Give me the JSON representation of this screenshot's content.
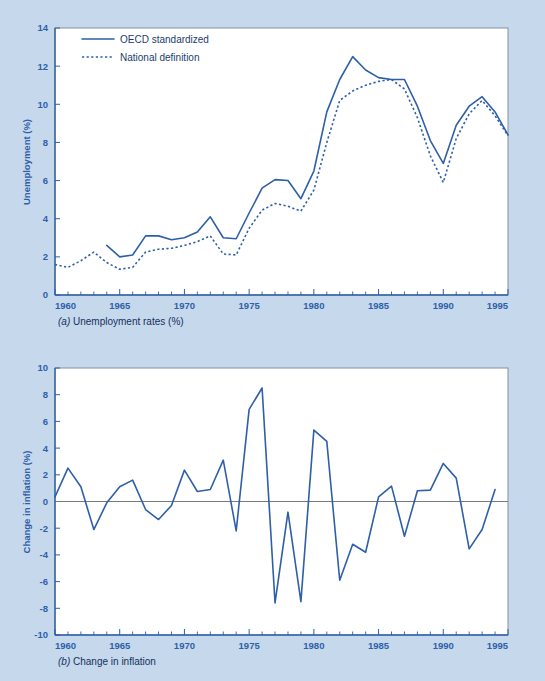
{
  "figure": {
    "background_color": "#c6d8ec",
    "line_color": "#2e5fa8",
    "plot_background": "#ffffff"
  },
  "chart_data": [
    {
      "type": "line",
      "panel": "a",
      "title": "",
      "caption_prefix": "(a)",
      "caption": " Unemployment rates (%)",
      "xlabel": "",
      "ylabel": "Unemployment (%)",
      "xlim": [
        1960,
        1995
      ],
      "ylim": [
        0,
        14
      ],
      "xticks": [
        1960,
        1965,
        1970,
        1975,
        1980,
        1985,
        1990,
        1995
      ],
      "xticklabels": [
        "1960",
        "1965",
        "1970",
        "1975",
        "1980",
        "1985",
        "1990",
        "1995"
      ],
      "yticks": [
        0,
        2,
        4,
        6,
        8,
        10,
        12,
        14
      ],
      "yticklabels": [
        "0",
        "2",
        "4",
        "6",
        "8",
        "10",
        "12",
        "14"
      ],
      "grid": false,
      "legend_position": "upper-left",
      "minor_x_tick_step": 1,
      "series": [
        {
          "name": "OECD standardized",
          "style": "solid",
          "x": [
            1964,
            1965,
            1966,
            1967,
            1968,
            1969,
            1970,
            1971,
            1972,
            1973,
            1974,
            1975,
            1976,
            1977,
            1978,
            1979,
            1980,
            1981,
            1982,
            1983,
            1984,
            1985,
            1986,
            1987,
            1988,
            1989,
            1990,
            1991,
            1992,
            1993,
            1994,
            1995
          ],
          "values": [
            2.6,
            2.0,
            2.1,
            3.1,
            3.1,
            2.9,
            3.0,
            3.3,
            4.1,
            3.0,
            2.95,
            4.3,
            5.6,
            6.05,
            6.0,
            5.05,
            6.5,
            9.6,
            11.3,
            12.5,
            11.8,
            11.4,
            11.3,
            11.3,
            9.9,
            8.1,
            6.9,
            8.9,
            9.9,
            10.4,
            9.6,
            8.4
          ]
        },
        {
          "name": "National definition",
          "style": "dotted",
          "x": [
            1960,
            1961,
            1962,
            1963,
            1964,
            1965,
            1966,
            1967,
            1968,
            1969,
            1970,
            1971,
            1972,
            1973,
            1974,
            1975,
            1976,
            1977,
            1978,
            1979,
            1980,
            1981,
            1982,
            1983,
            1984,
            1985,
            1986,
            1987,
            1988,
            1989,
            1990,
            1991,
            1992,
            1993,
            1994,
            1995
          ],
          "values": [
            1.6,
            1.45,
            1.8,
            2.25,
            1.7,
            1.35,
            1.45,
            2.25,
            2.4,
            2.45,
            2.6,
            2.8,
            3.1,
            2.15,
            2.1,
            3.5,
            4.45,
            4.8,
            4.65,
            4.4,
            5.5,
            8.0,
            10.2,
            10.7,
            11.0,
            11.2,
            11.3,
            10.8,
            9.3,
            7.3,
            5.9,
            8.2,
            9.5,
            10.2,
            9.4,
            8.35
          ]
        }
      ]
    },
    {
      "type": "line",
      "panel": "b",
      "title": "",
      "caption_prefix": "(b)",
      "caption": " Change in inflation",
      "xlabel": "",
      "ylabel": "Change in inflation (%)",
      "xlim": [
        1960,
        1995
      ],
      "ylim": [
        -10,
        10
      ],
      "xticks": [
        1960,
        1965,
        1970,
        1975,
        1980,
        1985,
        1990,
        1995
      ],
      "xticklabels": [
        "1960",
        "1965",
        "1970",
        "1975",
        "1980",
        "1985",
        "1990",
        "1995"
      ],
      "yticks": [
        -10,
        -8,
        -6,
        -4,
        -2,
        0,
        2,
        4,
        6,
        8,
        10
      ],
      "yticklabels": [
        "-10",
        "-8",
        "-6",
        "-4",
        "-2",
        "0",
        "2",
        "4",
        "6",
        "8",
        "10"
      ],
      "grid": false,
      "zero_line": true,
      "legend_position": "none",
      "minor_x_tick_step": 1,
      "series": [
        {
          "name": "Change in inflation",
          "style": "solid",
          "x": [
            1960,
            1961,
            1962,
            1963,
            1964,
            1965,
            1966,
            1967,
            1968,
            1969,
            1970,
            1971,
            1972,
            1973,
            1974,
            1975,
            1976,
            1977,
            1978,
            1979,
            1980,
            1981,
            1982,
            1983,
            1984,
            1985,
            1986,
            1987,
            1988,
            1989,
            1990,
            1991,
            1992,
            1993,
            1994
          ],
          "values": [
            0.35,
            2.5,
            1.1,
            -2.1,
            -0.1,
            1.1,
            1.6,
            -0.6,
            -1.35,
            -0.3,
            2.35,
            0.75,
            0.9,
            3.1,
            -2.2,
            6.9,
            8.5,
            -7.6,
            -0.8,
            -7.5,
            5.35,
            4.5,
            -5.9,
            -3.2,
            -3.8,
            0.35,
            1.15,
            -2.6,
            0.8,
            0.85,
            2.85,
            1.75,
            -3.55,
            -2.1,
            0.9
          ]
        }
      ]
    }
  ]
}
